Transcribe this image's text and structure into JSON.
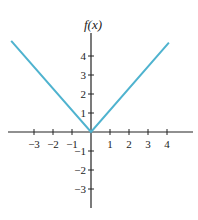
{
  "chart_data": {
    "type": "line",
    "title": "",
    "ylabel": "f(x)",
    "xlabel": "",
    "x_ticks": [
      "-3",
      "-2",
      "-1",
      "1",
      "2",
      "3",
      "4"
    ],
    "x_tick_values": [
      -3,
      -2,
      -1,
      1,
      2,
      3,
      4
    ],
    "y_ticks": [
      "4",
      "3",
      "2",
      "1",
      "-1",
      "-2",
      "-3"
    ],
    "y_tick_values": [
      4,
      3,
      2,
      1,
      -1,
      -2,
      -3
    ],
    "xlim": [
      -4.4,
      5.4
    ],
    "ylim": [
      -4.0,
      5.3
    ],
    "grid": false,
    "series": [
      {
        "name": "f(x) = |x|",
        "color": "#4fb3cf",
        "x": [
          -4.2,
          0,
          4.1
        ],
        "y": [
          4.8,
          0,
          4.7
        ]
      }
    ]
  },
  "colors": {
    "axis": "#222222",
    "line": "#4fb3cf"
  }
}
